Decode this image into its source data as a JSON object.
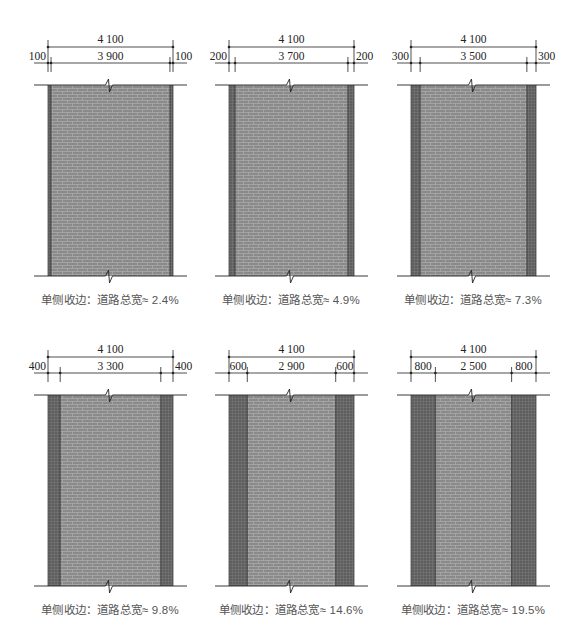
{
  "figure": {
    "total_width_mm": 4100,
    "colors": {
      "paving_field": "#8a8a8a",
      "paving_border": "#5e5e5e",
      "brick_line": "#b4b4b4",
      "border_line": "#3a3a3a",
      "dimension_line": "#222222",
      "caption_text": "#555555"
    },
    "panels": [
      {
        "total_label": "4 100",
        "edge_mm": 100,
        "edge_label": "100",
        "inner_label": "3 900",
        "caption": "单侧收边：道路总宽≈ 2.4%"
      },
      {
        "total_label": "4 100",
        "edge_mm": 200,
        "edge_label": "200",
        "inner_label": "3 700",
        "caption": "单侧收边：道路总宽≈ 4.9%"
      },
      {
        "total_label": "4 100",
        "edge_mm": 300,
        "edge_label": "300",
        "inner_label": "3 500",
        "caption": "单侧收边：道路总宽≈ 7.3%"
      },
      {
        "total_label": "4 100",
        "edge_mm": 400,
        "edge_label": "400",
        "inner_label": "3 300",
        "caption": "单侧收边：道路总宽≈ 9.8%"
      },
      {
        "total_label": "4 100",
        "edge_mm": 600,
        "edge_label": "600",
        "inner_label": "2 900",
        "caption": "单侧收边：道路总宽≈ 14.6%"
      },
      {
        "total_label": "4 100",
        "edge_mm": 800,
        "edge_label": "800",
        "inner_label": "2 500",
        "caption": "单侧收边：道路总宽≈ 19.5%"
      }
    ]
  }
}
